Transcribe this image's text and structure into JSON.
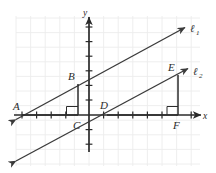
{
  "figure": {
    "type": "coordinate-geometry-diagram",
    "width": 216,
    "height": 173,
    "background_color": "#ffffff",
    "ink_color": "#3a3a3a",
    "grid_color": "#ececec",
    "axis_color": "#2b2b2b"
  },
  "axes": {
    "x_label": "x",
    "y_label": "y",
    "x_label_pos": {
      "x": 203,
      "y": 119
    },
    "y_label_pos": {
      "x": 84,
      "y": 16
    },
    "x_axis": {
      "x1": 14,
      "y1": 115,
      "x2": 200,
      "y2": 115
    },
    "y_axis": {
      "x1": 89,
      "y1": 18,
      "x2": 89,
      "y2": 150
    },
    "origin": {
      "x": 89,
      "y": 115
    },
    "grid_spacing": 14.6,
    "x_ticks": [
      22,
      36.6,
      51.2,
      65.8,
      74.4,
      103.6,
      118.2,
      132.8,
      147.4,
      162,
      176.6,
      191.2
    ],
    "y_ticks": [
      27,
      41.6,
      56.2,
      70.8,
      85.4,
      100,
      129.6,
      144.2
    ]
  },
  "lines": [
    {
      "name": "line-1",
      "label": "ℓ",
      "subscript": "1",
      "label_pos": {
        "x": 190,
        "y": 32
      },
      "start": {
        "x": 15,
        "y": 120
      },
      "end": {
        "x": 186,
        "y": 27
      },
      "arrow_start": true,
      "arrow_end": true
    },
    {
      "name": "line-2",
      "label": "ℓ",
      "subscript": "2",
      "label_pos": {
        "x": 193,
        "y": 76
      },
      "start": {
        "x": 15,
        "y": 162
      },
      "end": {
        "x": 189,
        "y": 68
      },
      "arrow_start": true,
      "arrow_end": true
    }
  ],
  "points": [
    {
      "name": "A",
      "label": "A",
      "x": 22,
      "y": 115,
      "label_x": 15,
      "label_y": 109,
      "on": "line-1"
    },
    {
      "name": "B",
      "label": "B",
      "x": 78,
      "y": 84,
      "label_x": 70,
      "label_y": 79,
      "on": "line-1"
    },
    {
      "name": "C",
      "label": "C",
      "x": 78,
      "y": 115,
      "label_x": 74,
      "label_y": 128,
      "on": "x-axis"
    },
    {
      "name": "D",
      "label": "D",
      "x": 107,
      "y": 115,
      "label_x": 101,
      "label_y": 108,
      "on": "line-2"
    },
    {
      "name": "E",
      "label": "E",
      "x": 178,
      "y": 75,
      "label_x": 170,
      "label_y": 70,
      "on": "line-2"
    },
    {
      "name": "F",
      "label": "F",
      "x": 178,
      "y": 115,
      "label_x": 174,
      "label_y": 128,
      "on": "x-axis"
    }
  ],
  "segments": [
    {
      "name": "segment-AC",
      "from": "A",
      "to": "C",
      "x1": 22,
      "y1": 115,
      "x2": 78,
      "y2": 115
    },
    {
      "name": "segment-BC",
      "from": "B",
      "to": "C",
      "x1": 78,
      "y1": 84,
      "x2": 78,
      "y2": 115
    },
    {
      "name": "segment-DF",
      "from": "D",
      "to": "F",
      "x1": 107,
      "y1": 115,
      "x2": 178,
      "y2": 115
    },
    {
      "name": "segment-EF",
      "from": "E",
      "to": "F",
      "x1": 178,
      "y1": 75,
      "x2": 178,
      "y2": 115
    }
  ],
  "right_angle_marks": [
    {
      "name": "right-angle-at-C",
      "vertex": "C",
      "x": 78,
      "y": 115,
      "size": 8,
      "dir_x": -1,
      "dir_y": -1
    },
    {
      "name": "right-angle-at-F",
      "vertex": "F",
      "x": 178,
      "y": 115,
      "size": 8,
      "dir_x": -1,
      "dir_y": -1
    }
  ]
}
